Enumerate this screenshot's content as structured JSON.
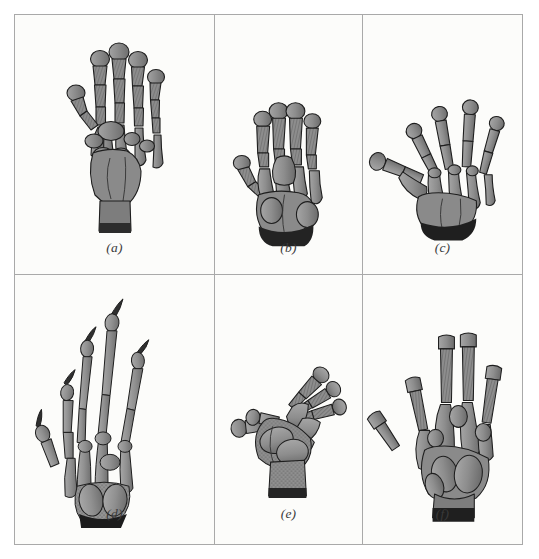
{
  "figure": {
    "background_color": "#fcfcfa",
    "frame_color": "#a9a9a9",
    "bone_fill": "#8f8f8f",
    "bone_outline": "#1c1c1c",
    "shadow_color": "#2a2a2a",
    "panels": [
      {
        "id": "a",
        "label": "(a)",
        "subject": "human-hand-skeleton",
        "description": "Human hand skeleton, palmar view: five slender digits, broad carpus, wrist stump.",
        "digits": 5
      },
      {
        "id": "b",
        "label": "(b)",
        "subject": "primate-hand-skeleton",
        "description": "Short broad hand skeleton with stout digits and splayed thumb.",
        "digits": 5
      },
      {
        "id": "c",
        "label": "(c)",
        "subject": "amphibian-forelimb-skeleton",
        "description": "Spread forelimb skeleton with widely separated digits and short metacarpals.",
        "digits": 5
      },
      {
        "id": "d",
        "label": "(d)",
        "subject": "clawed-limb-skeleton",
        "description": "Elongate limb skeleton with very long slender digits ending in curved claws.",
        "digits": 5
      },
      {
        "id": "e",
        "label": "(e)",
        "subject": "flipper-skeleton",
        "description": "Limb skeleton in lateral orientation, digits directed to the right, broad palm.",
        "digits": 5
      },
      {
        "id": "f",
        "label": "(f)",
        "subject": "hand-skeleton-variant",
        "description": "Hand skeleton with elongated middle digits and robust palm bones.",
        "digits": 5
      }
    ]
  }
}
